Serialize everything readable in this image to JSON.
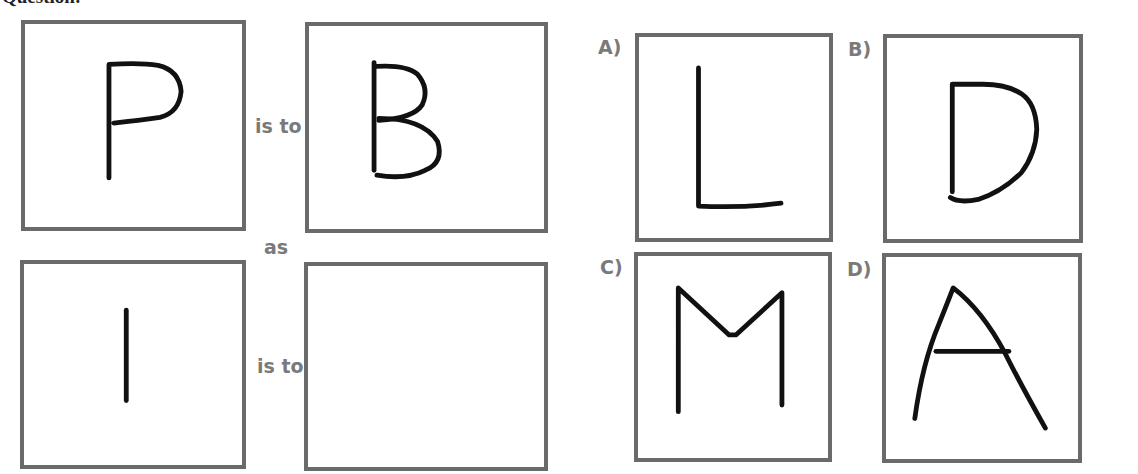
{
  "heading": "Question:",
  "question": {
    "connectors": {
      "is_to_1": "is to",
      "as": "as",
      "is_to_2": "is to"
    },
    "boxes": [
      {
        "id": "q1",
        "glyph": "P"
      },
      {
        "id": "q2",
        "glyph": "B"
      },
      {
        "id": "q3",
        "glyph": "I"
      },
      {
        "id": "q4",
        "glyph": ""
      }
    ]
  },
  "options": [
    {
      "label": "A)",
      "glyph": "L"
    },
    {
      "label": "B)",
      "glyph": "D"
    },
    {
      "label": "C)",
      "glyph": "M"
    },
    {
      "label": "D)",
      "glyph": "A"
    }
  ],
  "colors": {
    "border": "#6a6a6a",
    "stroke": "#111111",
    "label_text": "#7a7a7a"
  }
}
